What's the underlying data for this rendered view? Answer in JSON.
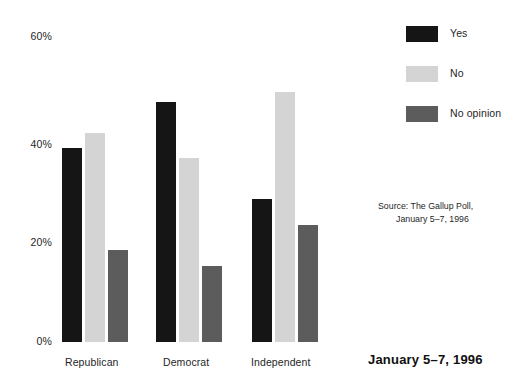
{
  "chart_data": {
    "type": "bar",
    "title": "January 5–7, 1996",
    "xlabel": "",
    "ylabel": "",
    "ylim": [
      0,
      60
    ],
    "grid": false,
    "legend_position": "top-right",
    "categories": [
      "Republican",
      "Democrat",
      "Independent"
    ],
    "y_ticks": [
      {
        "value": 60,
        "label": "60%"
      },
      {
        "value": 40,
        "label": "40%"
      },
      {
        "value": 20,
        "label": "20%"
      },
      {
        "value": 0,
        "label": "0%"
      }
    ],
    "series": [
      {
        "name": "Yes",
        "color": "#151515",
        "values": [
          38,
          47,
          28
        ]
      },
      {
        "name": "No",
        "color": "#d4d4d4",
        "values": [
          41,
          36,
          49
        ]
      },
      {
        "name": "No opinion",
        "color": "#5c5c5c",
        "values": [
          18,
          15,
          23
        ]
      }
    ],
    "annotations": {
      "source_line_1": "Source: The Gallup Poll,",
      "source_line_2": "January 5–7, 1996"
    }
  },
  "legend": {
    "items": [
      {
        "label": "Yes",
        "color": "#151515"
      },
      {
        "label": "No",
        "color": "#d4d4d4"
      },
      {
        "label": "No opinion",
        "color": "#5c5c5c"
      }
    ]
  },
  "colors": {
    "background": "#ffffff",
    "text": "#1f1f1f",
    "yes": "#151515",
    "no": "#d4d4d4",
    "no_opinion": "#5c5c5c"
  }
}
